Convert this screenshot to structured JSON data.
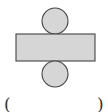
{
  "diagram": {
    "colors": {
      "fill": "#d6d6d6",
      "stroke": "#444444",
      "background": "#ffffff"
    },
    "shapes": [
      {
        "id": "top-circle",
        "type": "circle",
        "cx": 55,
        "cy": 21,
        "r": 13
      },
      {
        "id": "lateral-rectangle",
        "type": "rect",
        "x": 16,
        "y": 34,
        "width": 79,
        "height": 27
      },
      {
        "id": "bottom-circle",
        "type": "circle",
        "cx": 55,
        "cy": 74,
        "r": 13
      }
    ]
  },
  "answer": {
    "open_paren": "(",
    "blank": "",
    "close_paren": ")"
  }
}
